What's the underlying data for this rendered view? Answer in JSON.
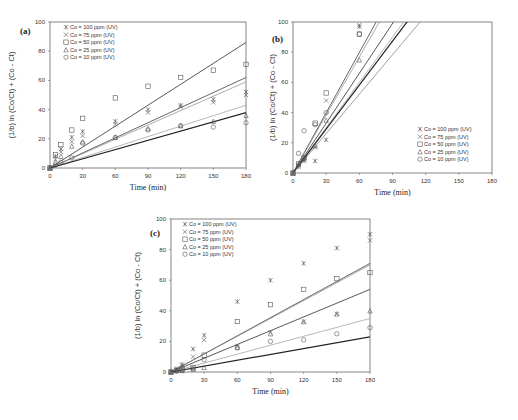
{
  "figure": {
    "x_ticks": [
      "0",
      "30",
      "60",
      "90",
      "120",
      "150",
      "180"
    ],
    "y_ticks": [
      "0",
      "20",
      "40",
      "60",
      "80",
      "100"
    ],
    "xlabel": "Time (min)",
    "ylabel": "(1/b) ln (Co/Ct) + (Co - Ct)"
  },
  "chart_data": [
    {
      "type": "scatter",
      "panel": "(a)",
      "title": "(a)",
      "xlabel": "Time (min)",
      "ylabel": "(1/b) ln (Co/Ct) + (Co - Ct)",
      "xlim": [
        0,
        180
      ],
      "ylim": [
        0,
        100
      ],
      "x_ticks": [
        0,
        30,
        60,
        90,
        120,
        150,
        180
      ],
      "y_ticks": [
        0,
        20,
        40,
        60,
        80,
        100
      ],
      "legend_position": "upper left",
      "grid": false,
      "series": [
        {
          "name": "Co = 100 ppm (UV)",
          "marker": "asterisk",
          "x": [
            0,
            5,
            10,
            20,
            30,
            60,
            90,
            120,
            150,
            180
          ],
          "y": [
            0,
            8,
            13,
            21,
            25,
            32,
            40,
            43,
            47,
            52
          ],
          "fit_end": 62
        },
        {
          "name": "Co = 75 ppm (UV)",
          "marker": "x",
          "x": [
            0,
            5,
            10,
            20,
            30,
            60,
            90,
            120,
            150,
            180
          ],
          "y": [
            0,
            6,
            11,
            18,
            22,
            30,
            38,
            42,
            45,
            50
          ],
          "fit_end": 59
        },
        {
          "name": "Co = 50 ppm (UV)",
          "marker": "square",
          "x": [
            0,
            5,
            10,
            20,
            30,
            60,
            90,
            120,
            150,
            180
          ],
          "y": [
            0,
            9,
            16,
            26,
            34,
            48,
            56,
            62,
            67,
            71
          ],
          "fit_end": 86
        },
        {
          "name": "Co = 25 ppm (UV)",
          "marker": "triangle",
          "x": [
            0,
            5,
            10,
            20,
            30,
            60,
            90,
            120,
            150,
            180
          ],
          "y": [
            0,
            4,
            8,
            15,
            18,
            21,
            27,
            29,
            32,
            36
          ],
          "fit_end": 43
        },
        {
          "name": "Co = 10 ppm (UV)",
          "marker": "circle",
          "x": [
            0,
            5,
            10,
            20,
            30,
            60,
            90,
            120,
            150,
            180
          ],
          "y": [
            0,
            2,
            4,
            7,
            17,
            21,
            26,
            29,
            28,
            31
          ],
          "fit_end": 38
        }
      ]
    },
    {
      "type": "scatter",
      "panel": "(b)",
      "title": "(b)",
      "xlabel": "Time (min)",
      "ylabel": "(1/b) ln (Co/Ct) + (Co - Ct)",
      "xlim": [
        0,
        180
      ],
      "ylim": [
        0,
        100
      ],
      "x_ticks": [
        0,
        30,
        60,
        90,
        120,
        150,
        180
      ],
      "y_ticks": [
        0,
        20,
        40,
        60,
        80,
        100
      ],
      "legend_position": "lower right",
      "grid": false,
      "series": [
        {
          "name": "Co = 100 ppm (UV)",
          "marker": "asterisk",
          "x": [
            0,
            5,
            10,
            20,
            30,
            60
          ],
          "y": [
            0,
            4,
            8,
            8,
            22,
            97
          ],
          "fit_slope": 0.87
        },
        {
          "name": "Co = 75 ppm (UV)",
          "marker": "x",
          "x": [
            0,
            5,
            10,
            20,
            30,
            60
          ],
          "y": [
            0,
            5,
            9,
            17,
            48,
            98
          ],
          "fit_slope": 1.28
        },
        {
          "name": "Co = 50 ppm (UV)",
          "marker": "square",
          "x": [
            0,
            5,
            10,
            20,
            30,
            60
          ],
          "y": [
            0,
            6,
            10,
            33,
            53,
            92
          ],
          "fit_slope": 1.33
        },
        {
          "name": "Co = 25 ppm (UV)",
          "marker": "triangle",
          "x": [
            0,
            5,
            10,
            20,
            30,
            60
          ],
          "y": [
            0,
            6,
            10,
            18,
            35,
            75
          ],
          "fit_slope": 1.1
        },
        {
          "name": "Co = 10 ppm (UV)",
          "marker": "circle",
          "x": [
            0,
            5,
            10,
            20,
            30,
            60
          ],
          "y": [
            0,
            13,
            28,
            32,
            40,
            92
          ],
          "fit_slope": 0.97
        }
      ],
      "fit_slopes": [
        1.33,
        1.28,
        1.1,
        1.0,
        0.97,
        0.87
      ]
    },
    {
      "type": "scatter",
      "panel": "(c)",
      "title": "(c)",
      "xlabel": "Time (min)",
      "ylabel": "(1/b) ln (Co/Ct) + (Co - Ct)",
      "xlim": [
        0,
        180
      ],
      "ylim": [
        0,
        100
      ],
      "x_ticks": [
        0,
        30,
        60,
        90,
        120,
        150,
        180
      ],
      "y_ticks": [
        0,
        20,
        40,
        60,
        80,
        100
      ],
      "legend_position": "upper left",
      "grid": false,
      "series": [
        {
          "name": "Co = 100 ppm (UV)",
          "marker": "asterisk",
          "x": [
            0,
            5,
            10,
            20,
            30,
            60,
            90,
            120,
            150,
            180
          ],
          "y": [
            0,
            2,
            5,
            15,
            24,
            46,
            60,
            71,
            81,
            90
          ],
          "fit_end": 71
        },
        {
          "name": "Co = 75 ppm (UV)",
          "marker": "x",
          "x": [
            0,
            5,
            10,
            20,
            30,
            60,
            90,
            120,
            150,
            180
          ],
          "y": [
            0,
            2,
            4,
            10,
            21,
            17,
            26,
            33,
            38,
            86
          ],
          "fit_end": 70
        },
        {
          "name": "Co = 50 ppm (UV)",
          "marker": "square",
          "x": [
            0,
            5,
            10,
            20,
            30,
            60,
            90,
            120,
            150,
            180
          ],
          "y": [
            0,
            1,
            2,
            3,
            11,
            33,
            44,
            54,
            61,
            65
          ],
          "fit_end": 54
        },
        {
          "name": "Co = 25 ppm (UV)",
          "marker": "triangle",
          "x": [
            0,
            5,
            10,
            20,
            30,
            60,
            90,
            120,
            150,
            180
          ],
          "y": [
            0,
            1,
            1,
            2,
            3,
            16,
            25,
            33,
            38,
            40
          ],
          "fit_end": 35
        },
        {
          "name": "Co = 10 ppm (UV)",
          "marker": "circle",
          "x": [
            0,
            5,
            10,
            20,
            30,
            60,
            90,
            120,
            150,
            180
          ],
          "y": [
            0,
            0.5,
            1,
            2,
            8,
            16,
            20,
            21,
            25,
            29
          ],
          "fit_end": 23
        }
      ]
    }
  ]
}
